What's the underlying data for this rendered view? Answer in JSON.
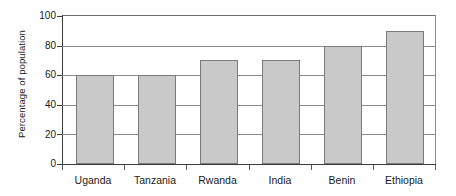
{
  "chart_data": {
    "type": "bar",
    "title": "",
    "xlabel": "",
    "ylabel": "Percentage of population",
    "categories": [
      "Uganda",
      "Tanzania",
      "Rwanda",
      "India",
      "Benin",
      "Ethiopia"
    ],
    "values": [
      60,
      60,
      70,
      70,
      80,
      90
    ],
    "ylim": [
      0,
      100
    ],
    "ytick_labels": [
      "0",
      "20",
      "40",
      "60",
      "80",
      "100"
    ],
    "ytick_values": [
      0,
      20,
      40,
      60,
      80,
      100
    ],
    "grid": "horizontal",
    "legend": "none",
    "bar_fill_color": "#c9c9c9",
    "bar_border_color": "#7b7b7b",
    "axis_color": "#3b3b3b",
    "gridline_color": "#8a8a8a",
    "background_color": "#ffffff"
  }
}
